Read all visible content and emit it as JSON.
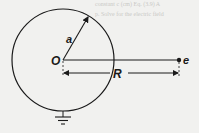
{
  "diagram": {
    "labels": {
      "radius": "a",
      "center": "O",
      "distance": "R",
      "charge": "e"
    },
    "background_text": {
      "line1": "constant c (cm) Eq. (3.9) A",
      "line2": "p. Solve for the electric field"
    },
    "colors": {
      "ink": "#1a1a1a",
      "paper": "#f1f1ef",
      "ghost": "#c9c9c6"
    }
  }
}
